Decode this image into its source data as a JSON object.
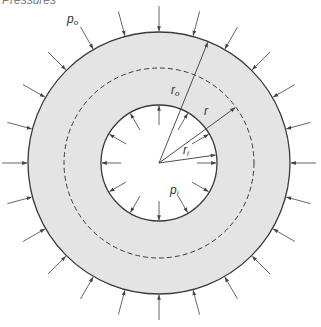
{
  "caption": "Pressures",
  "labels": {
    "p_outer": {
      "base": "p",
      "sub": "o"
    },
    "p_inner": {
      "base": "p",
      "sub": "i"
    },
    "r_outer": {
      "base": "r",
      "sub": "o"
    },
    "r_mid": {
      "base": "r",
      "sub": ""
    },
    "r_inner": {
      "base": "r",
      "sub": "i"
    }
  },
  "geometry": {
    "center": [
      159,
      163
    ],
    "outer_radius": 131,
    "inner_radius": 58,
    "dashed_radius": 95,
    "outer_arrow_count": 24,
    "outer_arrow_length": 26,
    "inner_arrow_count": 12,
    "inner_arrow_length": 20,
    "r_outer_angle_deg": 68,
    "r_mid_angle_deg": 36,
    "r_inner_angle_deg": 8
  },
  "colors": {
    "fill": "#e4e4e4",
    "line": "#3a3a3a",
    "arrow": "#555555",
    "background": "#ffffff"
  }
}
